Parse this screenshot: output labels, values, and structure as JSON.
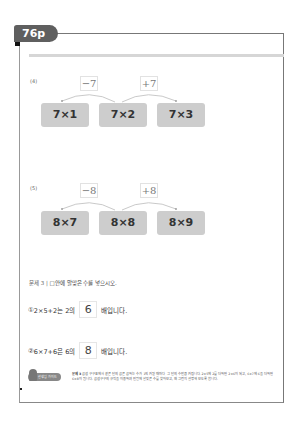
{
  "page_tab": {
    "label": "76p"
  },
  "problems": [
    {
      "label": "(4)",
      "ops": [
        "−7",
        "+7"
      ],
      "boxes": [
        "7×1",
        "7×2",
        "7×3"
      ]
    },
    {
      "label": "(5)",
      "ops": [
        "−8",
        "+8"
      ],
      "boxes": [
        "8×7",
        "8×8",
        "8×9"
      ]
    }
  ],
  "exercise": {
    "number": "문제 3 |",
    "instruction": "□안에 알맞은 수를 넣으시오.",
    "items": [
      {
        "index": "①",
        "expr": "2×5+2는 2의",
        "answer": "6",
        "suffix": "배입니다."
      },
      {
        "index": "②",
        "expr": "6×7+6은 6의",
        "answer": "8",
        "suffix": "배입니다."
      }
    ]
  },
  "tip": {
    "badge": "선생님 가이드",
    "heading": "문제 3",
    "text": "곱셈 구구표에서 같은 단의 곱은 곱하는 수가 1씩 커질 때마다 그 단의 수만큼 커집니다. 2×5에 2를 더하면 2×6이 되고, 6×7에 6을 더하면 6×8이 됩니다. 곱셈구구의 규칙을 이용하여 빈칸에 알맞은 수를 찾아보고, 왜 그런지 설명해 보도록 합니다."
  },
  "colors": {
    "tab": "#5f5f5f",
    "box": "#cdcdcd",
    "rule": "#d6d6d6"
  }
}
